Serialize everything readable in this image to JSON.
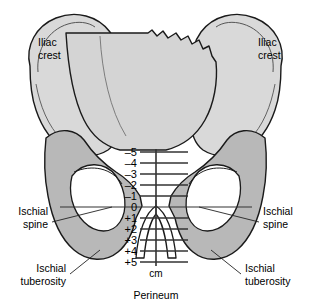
{
  "figure": {
    "caption": "Perineum",
    "background_color": "#ffffff"
  },
  "colors": {
    "bone_light": "#d9d9d9",
    "bone_mid": "#cfcfcf",
    "bone_dark": "#b3b3b3",
    "foramen": "#ffffff",
    "outline": "#1a1a1a",
    "line": "#333333",
    "text": "#000000"
  },
  "labels": {
    "iliac_crest_left": {
      "line1": "Iliac",
      "line2": "crest"
    },
    "iliac_crest_right": {
      "line1": "Iliac",
      "line2": "crest"
    },
    "ischial_spine_left": {
      "line1": "Ischial",
      "line2": "spine"
    },
    "ischial_spine_right": {
      "line1": "Ischial",
      "line2": "spine"
    },
    "ischial_tuberosity_left": {
      "line1": "Ischial",
      "line2": "tuberosity"
    },
    "ischial_tuberosity_right": {
      "line1": "Ischial",
      "line2": "tuberosity"
    },
    "perineum": "Perineum"
  },
  "scale": {
    "unit_label": "cm",
    "axis_label": "Station",
    "ticks": [
      {
        "label": "–5",
        "value": -5,
        "y": 152
      },
      {
        "label": "–4",
        "value": -4,
        "y": 163
      },
      {
        "label": "–3",
        "value": -3,
        "y": 174
      },
      {
        "label": "–2",
        "value": -2,
        "y": 185
      },
      {
        "label": "–1",
        "value": -1,
        "y": 196
      },
      {
        "label": "0",
        "value": 0,
        "y": 207
      },
      {
        "label": "+1",
        "value": 1,
        "y": 218
      },
      {
        "label": "+2",
        "value": 2,
        "y": 229
      },
      {
        "label": "+3",
        "value": 3,
        "y": 240
      },
      {
        "label": "+4",
        "value": 4,
        "y": 251
      },
      {
        "label": "+5",
        "value": 5,
        "y": 262
      }
    ]
  }
}
